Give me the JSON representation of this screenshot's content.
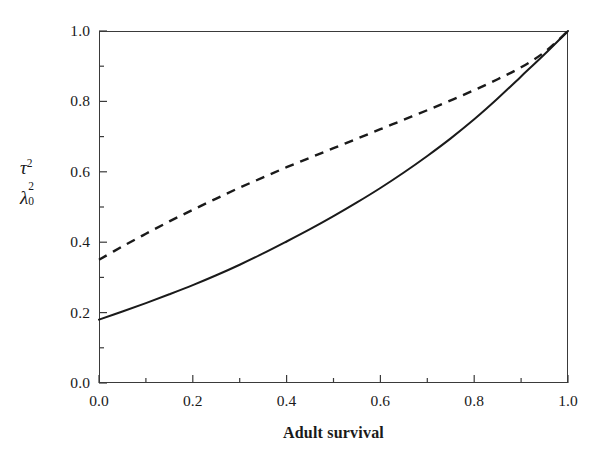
{
  "chart_data": {
    "type": "line",
    "title": "",
    "xlabel": "Adult survival",
    "ylabel": "tau^2 / lambda_0^2",
    "ylabel_parts": {
      "numerator_symbol": "τ",
      "numerator_exponent": "2",
      "denominator_symbol": "λ",
      "denominator_subscript": "0",
      "denominator_exponent": "2"
    },
    "xlim": [
      0.0,
      1.0
    ],
    "ylim": [
      0.0,
      1.0
    ],
    "x_ticks": [
      "0.0",
      "0.2",
      "0.4",
      "0.6",
      "0.8",
      "1.0"
    ],
    "x_tick_values": [
      0.0,
      0.2,
      0.4,
      0.6,
      0.8,
      1.0
    ],
    "x_minor_tick_values": [
      0.1,
      0.3,
      0.5,
      0.7,
      0.9
    ],
    "y_ticks": [
      "0.0",
      "0.2",
      "0.4",
      "0.6",
      "0.8",
      "1.0"
    ],
    "y_tick_values": [
      0.0,
      0.2,
      0.4,
      0.6,
      0.8,
      1.0
    ],
    "y_minor_tick_values": [
      0.1,
      0.3,
      0.5,
      0.7,
      0.9
    ],
    "grid": false,
    "legend": null,
    "frame": "full-box",
    "series": [
      {
        "name": "solid-curve",
        "style": "solid",
        "color": "#1a1a1a",
        "linewidth": 2.0,
        "x": [
          0.0,
          0.05,
          0.1,
          0.15,
          0.2,
          0.25,
          0.3,
          0.35,
          0.4,
          0.45,
          0.5,
          0.55,
          0.6,
          0.65,
          0.7,
          0.75,
          0.8,
          0.85,
          0.9,
          0.95,
          1.0
        ],
        "values": [
          0.18,
          0.203,
          0.227,
          0.252,
          0.278,
          0.306,
          0.336,
          0.368,
          0.402,
          0.437,
          0.474,
          0.513,
          0.554,
          0.598,
          0.645,
          0.695,
          0.749,
          0.808,
          0.871,
          0.934,
          1.0
        ]
      },
      {
        "name": "dashed-curve",
        "style": "dashed",
        "color": "#1a1a1a",
        "linewidth": 2.4,
        "dasharray": "9 7",
        "x": [
          0.0,
          0.05,
          0.1,
          0.15,
          0.2,
          0.25,
          0.3,
          0.35,
          0.4,
          0.45,
          0.5,
          0.55,
          0.6,
          0.65,
          0.7,
          0.75,
          0.8,
          0.85,
          0.9,
          0.95,
          1.0
        ],
        "values": [
          0.35,
          0.388,
          0.424,
          0.459,
          0.492,
          0.524,
          0.555,
          0.584,
          0.613,
          0.64,
          0.667,
          0.694,
          0.721,
          0.748,
          0.775,
          0.803,
          0.832,
          0.863,
          0.897,
          0.94,
          1.0
        ]
      }
    ]
  },
  "axes": {
    "x_title": "Adult survival"
  }
}
